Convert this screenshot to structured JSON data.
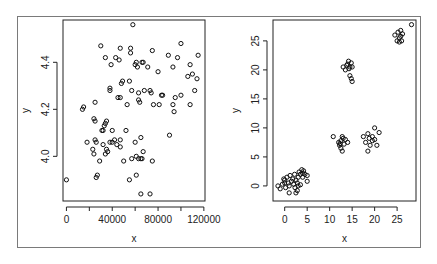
{
  "chart_data": [
    {
      "type": "scatter",
      "title": "",
      "xlabel": "x",
      "ylabel": "y",
      "xticks": [
        0,
        40000,
        80000,
        120000
      ],
      "xtick_labels": [
        "0",
        "40000",
        "80000",
        "120000"
      ],
      "yticks": [
        4.0,
        4.2,
        4.4
      ],
      "ytick_labels": [
        "4.0",
        "4.2",
        "4.4"
      ],
      "xlim": [
        -3000,
        121000
      ],
      "ylim": [
        3.81,
        4.58
      ],
      "grid": false,
      "marker": "open-circle",
      "points": [
        [
          58000,
          4.56
        ],
        [
          30000,
          4.47
        ],
        [
          47000,
          4.46
        ],
        [
          56000,
          4.46
        ],
        [
          75000,
          4.45
        ],
        [
          100000,
          4.48
        ],
        [
          89000,
          4.43
        ],
        [
          34000,
          4.42
        ],
        [
          43000,
          4.42
        ],
        [
          46000,
          4.41
        ],
        [
          56000,
          4.44
        ],
        [
          97000,
          4.42
        ],
        [
          115000,
          4.43
        ],
        [
          61000,
          4.4
        ],
        [
          66000,
          4.4
        ],
        [
          67000,
          4.4
        ],
        [
          39000,
          4.39
        ],
        [
          60000,
          4.39
        ],
        [
          62000,
          4.38
        ],
        [
          71000,
          4.38
        ],
        [
          93000,
          4.38
        ],
        [
          108000,
          4.39
        ],
        [
          80000,
          4.36
        ],
        [
          106000,
          4.34
        ],
        [
          110000,
          4.35
        ],
        [
          114000,
          4.33
        ],
        [
          49000,
          4.32
        ],
        [
          55000,
          4.32
        ],
        [
          48000,
          4.31
        ],
        [
          38000,
          4.29
        ],
        [
          38000,
          4.28
        ],
        [
          57000,
          4.28
        ],
        [
          68000,
          4.28
        ],
        [
          73000,
          4.28
        ],
        [
          74000,
          4.27
        ],
        [
          63000,
          4.27
        ],
        [
          83000,
          4.26
        ],
        [
          84000,
          4.26
        ],
        [
          100000,
          4.26
        ],
        [
          112000,
          4.28
        ],
        [
          95000,
          4.25
        ],
        [
          45000,
          4.25
        ],
        [
          47000,
          4.25
        ],
        [
          63000,
          4.24
        ],
        [
          64000,
          4.23
        ],
        [
          53000,
          4.22
        ],
        [
          76000,
          4.22
        ],
        [
          81000,
          4.22
        ],
        [
          93000,
          4.22
        ],
        [
          108000,
          4.22
        ],
        [
          94000,
          4.19
        ],
        [
          25000,
          4.23
        ],
        [
          15000,
          4.21
        ],
        [
          14000,
          4.2
        ],
        [
          24000,
          4.16
        ],
        [
          25000,
          4.15
        ],
        [
          35000,
          4.15
        ],
        [
          34000,
          4.14
        ],
        [
          33000,
          4.13
        ],
        [
          32000,
          4.11
        ],
        [
          31000,
          4.11
        ],
        [
          40000,
          4.11
        ],
        [
          52000,
          4.11
        ],
        [
          90000,
          4.09
        ],
        [
          65000,
          4.08
        ],
        [
          18000,
          4.06
        ],
        [
          25000,
          4.07
        ],
        [
          26000,
          4.06
        ],
        [
          38000,
          4.06
        ],
        [
          40000,
          4.06
        ],
        [
          42000,
          4.07
        ],
        [
          47000,
          4.07
        ],
        [
          60000,
          4.06
        ],
        [
          32000,
          4.05
        ],
        [
          44000,
          4.05
        ],
        [
          47000,
          4.04
        ],
        [
          23000,
          4.03
        ],
        [
          24000,
          4.01
        ],
        [
          35000,
          4.03
        ],
        [
          36000,
          4.02
        ],
        [
          34000,
          4.01
        ],
        [
          67000,
          4.02
        ],
        [
          61000,
          4.0
        ],
        [
          63000,
          3.99
        ],
        [
          57000,
          3.99
        ],
        [
          65000,
          3.99
        ],
        [
          66000,
          3.99
        ],
        [
          29000,
          3.98
        ],
        [
          50000,
          3.98
        ],
        [
          75000,
          3.98
        ],
        [
          27000,
          3.92
        ],
        [
          26000,
          3.91
        ],
        [
          61000,
          3.92
        ],
        [
          0,
          3.9
        ],
        [
          55000,
          3.9
        ],
        [
          65000,
          3.84
        ],
        [
          73000,
          3.84
        ]
      ]
    },
    {
      "type": "scatter",
      "title": "",
      "xlabel": "x",
      "ylabel": "y",
      "xticks": [
        0,
        5,
        10,
        15,
        20,
        25
      ],
      "xtick_labels": [
        "0",
        "5",
        "10",
        "15",
        "20",
        "25"
      ],
      "yticks": [
        0,
        5,
        10,
        15,
        20,
        25
      ],
      "ytick_labels": [
        "0",
        "5",
        "10",
        "15",
        "20",
        "25"
      ],
      "xlim": [
        -2.6,
        29.2
      ],
      "ylim": [
        -2.6,
        28.6
      ],
      "grid": false,
      "marker": "open-circle",
      "points": [
        [
          -1.5,
          0.0
        ],
        [
          -1.0,
          -0.5
        ],
        [
          -0.5,
          0.3
        ],
        [
          0,
          1.0
        ],
        [
          0.2,
          -0.3
        ],
        [
          0.5,
          1.5
        ],
        [
          0.8,
          0.5
        ],
        [
          1.0,
          0.0
        ],
        [
          1.2,
          1.8
        ],
        [
          1.5,
          0.8
        ],
        [
          1.8,
          1.2
        ],
        [
          2.0,
          0.3
        ],
        [
          2.2,
          2.0
        ],
        [
          2.5,
          1.0
        ],
        [
          2.8,
          0.5
        ],
        [
          3.0,
          1.5
        ],
        [
          3.2,
          2.4
        ],
        [
          3.5,
          2.0
        ],
        [
          3.8,
          2.8
        ],
        [
          4.0,
          2.2
        ],
        [
          4.2,
          2.6
        ],
        [
          4.5,
          2.0
        ],
        [
          5.0,
          1.8
        ],
        [
          5.0,
          0.8
        ],
        [
          3.5,
          0.2
        ],
        [
          2.8,
          -0.8
        ],
        [
          2.3,
          -0.3
        ],
        [
          1.0,
          -1.2
        ],
        [
          2.5,
          -1.2
        ],
        [
          0.0,
          0.5
        ],
        [
          -0.2,
          1.2
        ],
        [
          3.0,
          0.0
        ],
        [
          4.0,
          1.5
        ],
        [
          10.8,
          8.5
        ],
        [
          12.0,
          7.5
        ],
        [
          12.2,
          7.0
        ],
        [
          12.5,
          7.8
        ],
        [
          12.8,
          8.5
        ],
        [
          13.0,
          8.2
        ],
        [
          12.5,
          6.5
        ],
        [
          12.8,
          6.0
        ],
        [
          13.2,
          7.2
        ],
        [
          13.5,
          8.0
        ],
        [
          14.0,
          7.5
        ],
        [
          12.3,
          7.3
        ],
        [
          17.5,
          8.5
        ],
        [
          18.0,
          7.5
        ],
        [
          18.5,
          9.0
        ],
        [
          18.8,
          8.2
        ],
        [
          19.0,
          7.0
        ],
        [
          19.5,
          7.8
        ],
        [
          20.0,
          8.0
        ],
        [
          20.0,
          10.0
        ],
        [
          20.5,
          7.0
        ],
        [
          21.0,
          9.2
        ],
        [
          18.5,
          6.0
        ],
        [
          19.5,
          8.5
        ],
        [
          13.0,
          20.5
        ],
        [
          13.5,
          20.0
        ],
        [
          14.0,
          21.0
        ],
        [
          14.2,
          21.5
        ],
        [
          14.5,
          20.5
        ],
        [
          14.8,
          21.2
        ],
        [
          15.0,
          20.5
        ],
        [
          13.8,
          20.8
        ],
        [
          14.5,
          19.0
        ],
        [
          14.8,
          18.5
        ],
        [
          15.0,
          18.0
        ],
        [
          14.3,
          20.2
        ],
        [
          24.5,
          26.0
        ],
        [
          25.0,
          25.0
        ],
        [
          25.2,
          26.5
        ],
        [
          25.5,
          25.5
        ],
        [
          25.8,
          26.8
        ],
        [
          26.0,
          25.0
        ],
        [
          26.2,
          26.2
        ],
        [
          25.5,
          24.8
        ],
        [
          25.8,
          25.8
        ],
        [
          28.2,
          27.8
        ]
      ]
    }
  ],
  "panels": [
    {
      "xlabel": "x",
      "ylabel": "y"
    },
    {
      "xlabel": "x",
      "ylabel": "y"
    }
  ]
}
